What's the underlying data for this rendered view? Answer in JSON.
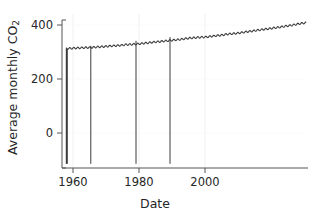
{
  "chart_data": {
    "type": "line",
    "title": "",
    "xlabel": "Date",
    "ylabel": "Average monthly CO2",
    "ylabel_plain": "Average monthly CO",
    "ylabel_sub": "2",
    "xlim": [
      1957.0,
      2018.0
    ],
    "ylim": [
      -115,
      440
    ],
    "xticks": [
      1960,
      1980,
      2000
    ],
    "xtick_labels": [
      "1960",
      "1980",
      "2000"
    ],
    "yticks": [
      0,
      200,
      400
    ],
    "ytick_labels": [
      "0",
      "200",
      "400"
    ],
    "grid": "vertical-light",
    "legend": "none",
    "line_color": "#3b3b3b",
    "series": [
      {
        "name": "Average monthly CO2",
        "description": "Monthly mean atmospheric CO2 concentration (ppm) with seasonal sawtooth oscillation rising from about 315 ppm in 1958 to about 415 ppm in 2018. Four downward spikes to about -100 mark missing-data sentinel values.",
        "x": [
          1958.0,
          1959.0,
          1960.0,
          1961.0,
          1962.0,
          1963.0,
          1964.0,
          1965.0,
          1966.0,
          1967.0,
          1968.0,
          1969.0,
          1970.0,
          1971.0,
          1972.0,
          1973.0,
          1974.0,
          1975.0,
          1976.0,
          1977.0,
          1978.0,
          1979.0,
          1980.0,
          1981.0,
          1982.0,
          1983.0,
          1984.0,
          1985.0,
          1986.0,
          1987.0,
          1988.0,
          1989.0,
          1990.0,
          1991.0,
          1992.0,
          1993.0,
          1994.0,
          1995.0,
          1996.0,
          1997.0,
          1998.0,
          1999.0,
          2000.0,
          2001.0,
          2002.0,
          2003.0,
          2004.0,
          2005.0,
          2006.0,
          2007.0,
          2008.0,
          2009.0,
          2010.0,
          2011.0,
          2012.0,
          2013.0,
          2014.0,
          2015.0,
          2016.0,
          2017.0,
          2018.0
        ],
        "y": [
          315.3,
          315.9,
          316.9,
          317.6,
          318.4,
          318.9,
          319.2,
          320.0,
          321.3,
          322.1,
          323.0,
          324.6,
          325.6,
          326.3,
          327.4,
          329.6,
          330.2,
          331.1,
          332.0,
          333.8,
          335.4,
          336.8,
          338.7,
          340.1,
          341.4,
          343.0,
          344.6,
          346.0,
          347.4,
          349.2,
          351.6,
          353.1,
          354.4,
          355.6,
          356.4,
          357.1,
          358.8,
          360.8,
          362.6,
          363.8,
          366.6,
          368.3,
          369.5,
          371.0,
          373.1,
          375.6,
          377.4,
          379.6,
          381.8,
          383.7,
          385.6,
          387.4,
          389.9,
          391.6,
          393.8,
          396.5,
          398.6,
          400.8,
          404.2,
          406.5,
          408.5
        ],
        "annual_amplitude": 6.0,
        "spikes": [
          {
            "x": 1958.2,
            "y_bottom": -100,
            "width_px": 2
          },
          {
            "x": 1964.2,
            "y_bottom": -100,
            "width_px": 1
          },
          {
            "x": 1975.5,
            "y_bottom": -100,
            "width_px": 1
          },
          {
            "x": 1984.0,
            "y_bottom": -100,
            "width_px": 1
          }
        ]
      }
    ]
  },
  "axes": {
    "xlabel": "Date",
    "ytick_labels": [
      "400",
      "200",
      "0"
    ],
    "xtick_labels": [
      "1960",
      "1980",
      "2000"
    ]
  }
}
